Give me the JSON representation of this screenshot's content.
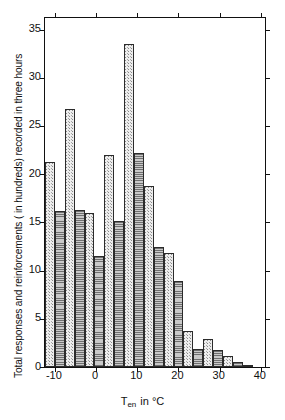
{
  "chart_data": {
    "type": "bar",
    "title": "",
    "subtitle": "",
    "xlabel": "T_en in °C",
    "xlabel_parts": {
      "base": "T",
      "subscript": "en",
      "rest": "in °C"
    },
    "ylabel": "Total responses and reinforcements (in hundreds) recorded in three hours",
    "xlim": [
      -12.4,
      41.0
    ],
    "ylim": [
      0,
      36.2
    ],
    "ytick_labels": [
      "0",
      "5",
      "10",
      "15",
      "20",
      "25",
      "30",
      "35"
    ],
    "ytick_values": [
      0,
      5,
      10,
      15,
      20,
      25,
      30,
      35
    ],
    "xtick_labels": [
      "-10",
      "0",
      "10",
      "20",
      "30",
      "40"
    ],
    "xtick_values": [
      -10,
      0,
      10,
      20,
      30,
      40
    ],
    "grid": false,
    "legend": false,
    "bin_width": 2.4,
    "bars": [
      {
        "x0": -12.4,
        "x1": -10.0,
        "value": 21.3,
        "fill": "light"
      },
      {
        "x0": -10.0,
        "x1": -7.6,
        "value": 16.2,
        "fill": "dark"
      },
      {
        "x0": -7.6,
        "x1": -5.2,
        "value": 26.8,
        "fill": "light"
      },
      {
        "x0": -5.2,
        "x1": -2.8,
        "value": 16.3,
        "fill": "dark"
      },
      {
        "x0": -2.8,
        "x1": -0.4,
        "value": 16.0,
        "fill": "light"
      },
      {
        "x0": -0.4,
        "x1": 2.0,
        "value": 11.5,
        "fill": "dark"
      },
      {
        "x0": 2.0,
        "x1": 4.4,
        "value": 22.0,
        "fill": "light"
      },
      {
        "x0": 4.4,
        "x1": 6.8,
        "value": 15.1,
        "fill": "dark"
      },
      {
        "x0": 6.8,
        "x1": 9.2,
        "value": 33.5,
        "fill": "light"
      },
      {
        "x0": 9.2,
        "x1": 11.6,
        "value": 22.2,
        "fill": "dark"
      },
      {
        "x0": 11.6,
        "x1": 14.0,
        "value": 18.8,
        "fill": "light"
      },
      {
        "x0": 14.0,
        "x1": 16.4,
        "value": 12.4,
        "fill": "dark"
      },
      {
        "x0": 16.4,
        "x1": 18.8,
        "value": 11.8,
        "fill": "light"
      },
      {
        "x0": 18.8,
        "x1": 21.2,
        "value": 8.9,
        "fill": "dark"
      },
      {
        "x0": 21.2,
        "x1": 23.6,
        "value": 3.7,
        "fill": "light"
      },
      {
        "x0": 23.6,
        "x1": 26.0,
        "value": 1.9,
        "fill": "dark"
      },
      {
        "x0": 26.0,
        "x1": 28.4,
        "value": 2.9,
        "fill": "light"
      },
      {
        "x0": 28.4,
        "x1": 30.8,
        "value": 1.8,
        "fill": "dark"
      },
      {
        "x0": 30.8,
        "x1": 33.2,
        "value": 1.1,
        "fill": "light"
      },
      {
        "x0": 33.2,
        "x1": 35.6,
        "value": 0.5,
        "fill": "dark"
      },
      {
        "x0": 35.6,
        "x1": 38.0,
        "value": 0.2,
        "fill": "light"
      }
    ]
  },
  "axes": {
    "y_title": "Total responses and reinforcements ( in hundreds) recorded in three hours",
    "x_title_base": "T",
    "x_title_sub": "en",
    "x_title_rest": "in °C"
  }
}
